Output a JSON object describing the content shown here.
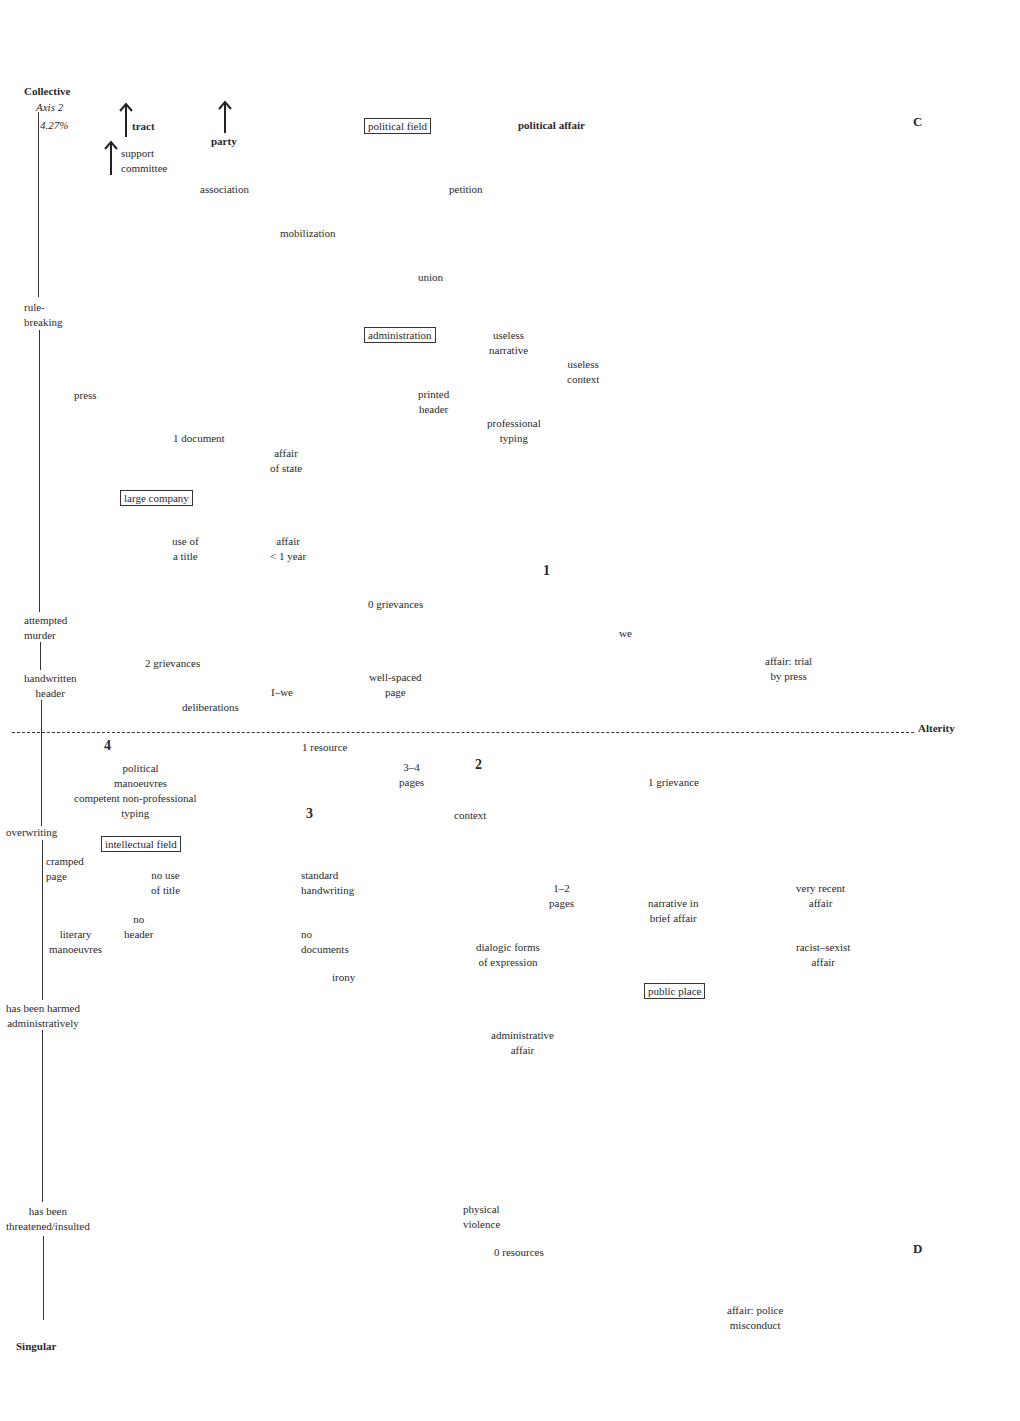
{
  "diagram": {
    "type": "factorial-plane",
    "vertical_axis": {
      "top_label": "Collective",
      "bottom_label": "Singular",
      "name": "Axis 2",
      "inertia": "4.27%"
    },
    "horizontal_axis": {
      "right_label": "Alterity"
    },
    "quadrant_labels": {
      "C": "C",
      "D": "D"
    },
    "cluster_numbers": {
      "one": "1",
      "two": "2",
      "three": "3",
      "four": "4"
    },
    "axis_side_labels": {
      "rule_breaking": "rule-\nbreaking",
      "attempted_murder": "attempted\nmurder",
      "handwritten_header": "handwritten\nheader",
      "overwriting": "overwriting",
      "has_been_harmed": "has been harmed\nadministratively",
      "has_been_threatened": "has been\nthreatened/insulted"
    },
    "arrow_labels": {
      "tract": "tract",
      "party": "party",
      "support_committee": "support\ncommittee"
    },
    "boxed_labels": {
      "political_field": "political field",
      "administration": "administration",
      "large_company": "large company",
      "intellectual_field": "intellectual field",
      "public_place": "public place"
    },
    "points": {
      "political_affair": "political affair",
      "association": "association",
      "petition": "petition",
      "mobilization": "mobilization",
      "union": "union",
      "useless_narrative": "useless\nnarrative",
      "useless_context": "useless\ncontext",
      "press": "press",
      "printed_header": "printed\nheader",
      "professional_typing": "professional\ntyping",
      "one_document": "1 document",
      "affair_of_state": "affair\nof state",
      "use_of_a_title": "use of\na title",
      "affair_lt_1_year": "affair\n< 1 year",
      "zero_grievances": "0 grievances",
      "we": "we",
      "two_grievances": "2 grievances",
      "well_spaced_page": "well-spaced\npage",
      "affair_trial_by_press": "affair: trial\nby press",
      "i_we": "I–we",
      "deliberations": "deliberations",
      "one_resource": "1 resource",
      "political_manoeuvres": "political\nmanoeuvres",
      "three_four_pages": "3–4\npages",
      "one_grievance": "1 grievance",
      "competent_typing": "competent non-professional\ntyping",
      "context": "context",
      "cramped_page": "cramped\npage",
      "no_use_of_title": "no use\nof title",
      "standard_handwriting": "standard\nhandwriting",
      "one_two_pages": "1–2\npages",
      "very_recent_affair": "very recent\naffair",
      "narrative_brief_affair": "narrative in\nbrief affair",
      "no_header": "no\nheader",
      "literary_manoeuvres": "literary\nmanoeuvres",
      "no_documents": "no\ndocuments",
      "dialogic_forms": "dialogic forms\nof expression",
      "racist_sexist_affair": "racist–sexist\naffair",
      "irony": "irony",
      "administrative_affair": "administrative\naffair",
      "physical_violence": "physical\nviolence",
      "zero_resources": "0 resources",
      "police_misconduct": "affair: police\nmisconduct"
    }
  }
}
